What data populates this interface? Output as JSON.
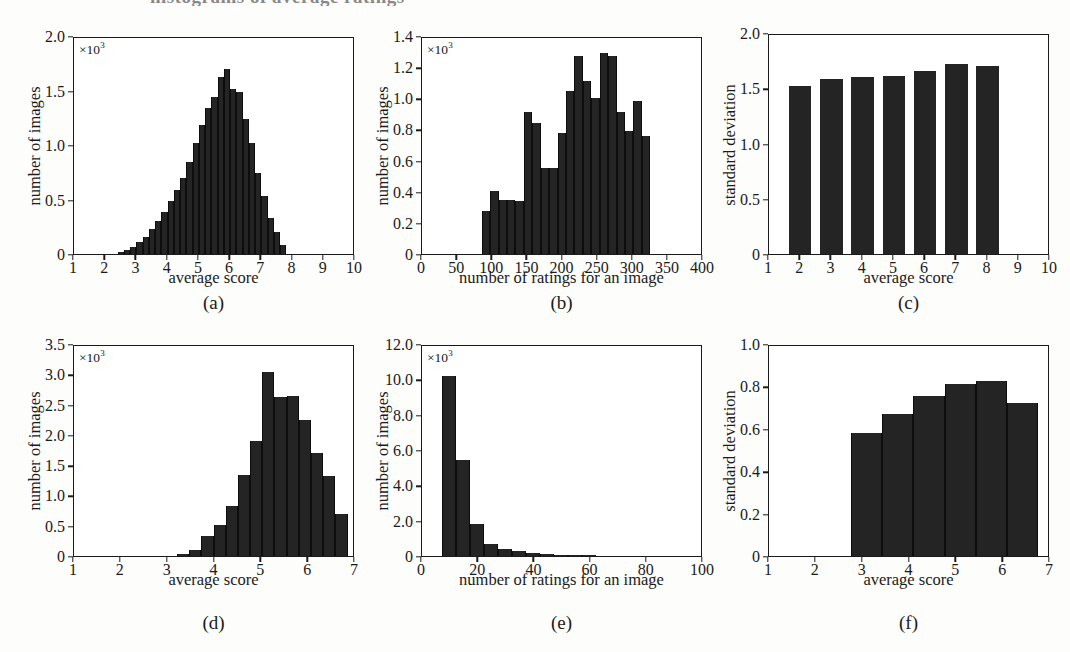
{
  "figure": {
    "cut_off_top_text": "histograms of average ratings",
    "panel_captions": [
      "(a)",
      "(b)",
      "(c)",
      "(d)",
      "(e)",
      "(f)"
    ]
  },
  "chart_data": [
    {
      "id": "a",
      "caption": "(a)",
      "type": "bar",
      "title": "",
      "xlabel": "average score",
      "ylabel": "number of images",
      "y_exponent": "×10",
      "y_exponent_power": "3",
      "xlim": [
        1,
        10
      ],
      "ylim": [
        0,
        2000
      ],
      "xticks": [
        1,
        2,
        3,
        4,
        5,
        6,
        7,
        8,
        9,
        10
      ],
      "yticks": [
        0,
        500,
        1000,
        1500,
        2000
      ],
      "ytick_labels": [
        "0",
        "0.5",
        "1.0",
        "1.5",
        "2.0"
      ],
      "grid": false,
      "bin_width": 0.2,
      "bin_starts": [
        2.4,
        2.6,
        2.8,
        3.0,
        3.2,
        3.4,
        3.6,
        3.8,
        4.0,
        4.2,
        4.4,
        4.6,
        4.8,
        5.0,
        5.2,
        5.4,
        5.6,
        5.8,
        6.0,
        6.2,
        6.4,
        6.6,
        6.8,
        7.0,
        7.2,
        7.4,
        7.6
      ],
      "values": [
        20,
        40,
        60,
        110,
        160,
        230,
        300,
        390,
        490,
        590,
        700,
        840,
        1020,
        1180,
        1340,
        1440,
        1620,
        1700,
        1510,
        1490,
        1240,
        1020,
        740,
        530,
        330,
        200,
        80
      ]
    },
    {
      "id": "b",
      "caption": "(b)",
      "type": "bar",
      "title": "",
      "xlabel": "number of ratings for an image",
      "ylabel": "number of images",
      "y_exponent": "×10",
      "y_exponent_power": "3",
      "xlim": [
        0,
        400
      ],
      "ylim": [
        0,
        1400
      ],
      "xticks": [
        0,
        50,
        100,
        150,
        200,
        250,
        300,
        350,
        400
      ],
      "yticks": [
        0,
        200,
        400,
        600,
        800,
        1000,
        1200,
        1400
      ],
      "ytick_labels": [
        "0",
        "0.2",
        "0.4",
        "0.6",
        "0.8",
        "1.0",
        "1.2",
        "1.4"
      ],
      "grid": false,
      "bin_width": 12,
      "bin_starts": [
        85,
        97,
        109,
        121,
        133,
        145,
        157,
        169,
        181,
        193,
        205,
        217,
        229,
        241,
        253,
        265,
        277,
        289,
        301,
        313
      ],
      "values": [
        275,
        405,
        345,
        350,
        340,
        910,
        840,
        550,
        555,
        775,
        1050,
        1270,
        1110,
        1000,
        1290,
        1270,
        910,
        790,
        980,
        760
      ]
    },
    {
      "id": "c",
      "caption": "(c)",
      "type": "bar",
      "title": "",
      "xlabel": "average score",
      "ylabel": "standard deviation",
      "xlim": [
        1,
        10
      ],
      "ylim": [
        0,
        2.0
      ],
      "xticks": [
        1,
        2,
        3,
        4,
        5,
        6,
        7,
        8,
        9,
        10
      ],
      "yticks": [
        0,
        0.5,
        1.0,
        1.5,
        2.0
      ],
      "ytick_labels": [
        "0",
        "0.5",
        "1.0",
        "1.5",
        "2.0"
      ],
      "grid": false,
      "categories": [
        2,
        3,
        4,
        5,
        6,
        7,
        8
      ],
      "values": [
        1.52,
        1.58,
        1.6,
        1.61,
        1.66,
        1.72,
        1.7
      ]
    },
    {
      "id": "d",
      "caption": "(d)",
      "type": "bar",
      "title": "",
      "xlabel": "average score",
      "ylabel": "number of images",
      "y_exponent": "×10",
      "y_exponent_power": "3",
      "xlim": [
        1,
        7
      ],
      "ylim": [
        0,
        3500
      ],
      "xticks": [
        1,
        2,
        3,
        4,
        5,
        6,
        7
      ],
      "yticks": [
        0,
        500,
        1000,
        1500,
        2000,
        2500,
        3000,
        3500
      ],
      "ytick_labels": [
        "0",
        "0.5",
        "1.0",
        "1.5",
        "2.0",
        "2.5",
        "3.0",
        "3.5"
      ],
      "grid": false,
      "bin_width": 0.26,
      "bin_starts": [
        3.2,
        3.46,
        3.72,
        3.98,
        4.24,
        4.5,
        4.76,
        5.02,
        5.28,
        5.54,
        5.8,
        6.06,
        6.32,
        6.58
      ],
      "values": [
        40,
        105,
        330,
        520,
        830,
        1330,
        1900,
        3030,
        2630,
        2650,
        2250,
        1700,
        1320,
        700
      ]
    },
    {
      "id": "e",
      "caption": "(e)",
      "type": "bar",
      "title": "",
      "xlabel": "number of ratings for an image",
      "ylabel": "number of images",
      "y_exponent": "×10",
      "y_exponent_power": "3",
      "xlim": [
        0,
        100
      ],
      "ylim": [
        0,
        12000
      ],
      "xticks": [
        0,
        20,
        40,
        60,
        80,
        100
      ],
      "yticks": [
        0,
        2000,
        4000,
        6000,
        8000,
        10000,
        12000
      ],
      "ytick_labels": [
        "0",
        "2.0",
        "4.0",
        "6.0",
        "8.0",
        "10.0",
        "12.0"
      ],
      "grid": false,
      "bin_width": 5,
      "bin_starts": [
        7,
        12,
        17,
        22,
        27,
        32,
        37,
        42,
        47,
        52,
        57
      ],
      "values": [
        10200,
        5450,
        1800,
        700,
        420,
        290,
        190,
        130,
        80,
        40,
        20
      ]
    },
    {
      "id": "f",
      "caption": "(f)",
      "type": "bar",
      "title": "",
      "xlabel": "average score",
      "ylabel": "standard deviation",
      "xlim": [
        1,
        7
      ],
      "ylim": [
        0,
        1.0
      ],
      "xticks": [
        1,
        2,
        3,
        4,
        5,
        6,
        7
      ],
      "yticks": [
        0,
        0.2,
        0.4,
        0.6,
        0.8,
        1.0
      ],
      "ytick_labels": [
        "0",
        "0.2",
        "0.4",
        "0.6",
        "0.8",
        "1.0"
      ],
      "grid": false,
      "bin_width": 0.666,
      "bin_starts": [
        2.75,
        3.416,
        4.082,
        4.748,
        5.414,
        6.08
      ],
      "values": [
        0.58,
        0.67,
        0.755,
        0.81,
        0.825,
        0.72
      ]
    }
  ]
}
